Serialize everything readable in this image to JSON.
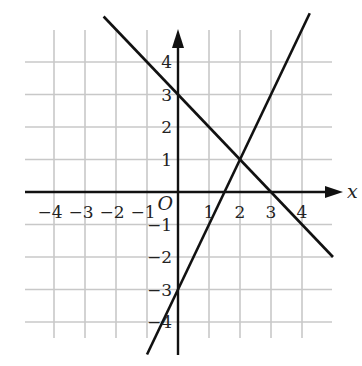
{
  "chart_data": {
    "type": "line",
    "title": "",
    "xlabel": "x",
    "ylabel": "",
    "origin_label": "O",
    "xlim": [
      -4.5,
      4.5
    ],
    "ylim": [
      -4.5,
      4.5
    ],
    "grid": true,
    "x_ticks": [
      -4,
      -3,
      -2,
      -1,
      1,
      2,
      3,
      4
    ],
    "y_ticks": [
      -4,
      -3,
      -2,
      -1,
      1,
      2,
      3,
      4
    ],
    "x_tick_labels": [
      "−4",
      "−3",
      "−2",
      "−1",
      "1",
      "2",
      "3",
      "4"
    ],
    "y_tick_labels": [
      "−4",
      "−3",
      "−2",
      "−1",
      "1",
      "2",
      "3",
      "4"
    ],
    "series": [
      {
        "name": "line-decreasing",
        "equation": "y = -x + 3",
        "x": [
          -2.4,
          5.0
        ],
        "y": [
          5.4,
          -2.0
        ],
        "key_points": [
          [
            0,
            3
          ],
          [
            3,
            0
          ],
          [
            2,
            1
          ]
        ]
      },
      {
        "name": "line-increasing",
        "equation": "y = 2x - 3",
        "x": [
          -1.0,
          4.25
        ],
        "y": [
          -5.0,
          5.5
        ],
        "key_points": [
          [
            0,
            -3
          ],
          [
            1.5,
            0
          ],
          [
            2,
            1
          ]
        ]
      }
    ],
    "intersection": [
      2,
      1
    ]
  },
  "style": {
    "grid_color": "#c8c8c8",
    "axis_color": "#111111",
    "line_color": "#111111",
    "background": "#ffffff"
  }
}
